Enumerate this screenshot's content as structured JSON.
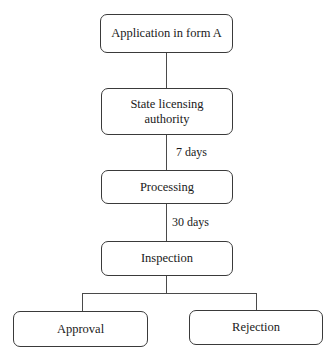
{
  "diagram": {
    "type": "flowchart",
    "nodes": [
      {
        "id": "application",
        "label": "Application in form A"
      },
      {
        "id": "state_authority",
        "label": "State licensing authority"
      },
      {
        "id": "processing",
        "label": "Processing"
      },
      {
        "id": "inspection",
        "label": "Inspection"
      },
      {
        "id": "approval",
        "label": "Approval"
      },
      {
        "id": "rejection",
        "label": "Rejection"
      }
    ],
    "edges": [
      {
        "from": "application",
        "to": "state_authority",
        "label": ""
      },
      {
        "from": "state_authority",
        "to": "processing",
        "label": "7 days"
      },
      {
        "from": "processing",
        "to": "inspection",
        "label": "30 days"
      },
      {
        "from": "inspection",
        "to": "approval",
        "label": ""
      },
      {
        "from": "inspection",
        "to": "rejection",
        "label": ""
      }
    ]
  }
}
